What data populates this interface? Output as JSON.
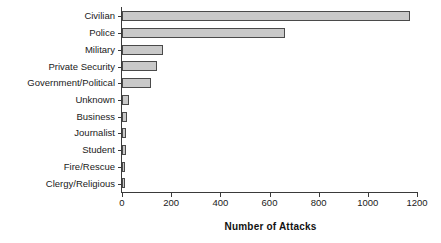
{
  "chart_data": {
    "type": "bar",
    "orientation": "horizontal",
    "title": "",
    "xlabel": "Number of Attacks",
    "ylabel": "",
    "categories": [
      "Clergy/Religious",
      "Fire/Rescue",
      "Student",
      "Journalist",
      "Business",
      "Unknown",
      "Government/Political",
      "Private Security",
      "Military",
      "Police",
      "Civilian"
    ],
    "values": [
      12,
      14,
      16,
      18,
      22,
      30,
      118,
      142,
      165,
      665,
      1172
    ],
    "xlim": [
      0,
      1200
    ],
    "xticks": [
      0,
      200,
      400,
      600,
      800,
      1000,
      1200
    ],
    "xtick_labels": [
      "0",
      "200",
      "400",
      "600",
      "800",
      "1000",
      "1200"
    ],
    "grid": false,
    "legend": false,
    "bar_fill_color": "#c9c9c9",
    "bar_border_color": "#4a4a4a",
    "axis_color": "#3a3a3a",
    "background_color": "#ffffff"
  }
}
